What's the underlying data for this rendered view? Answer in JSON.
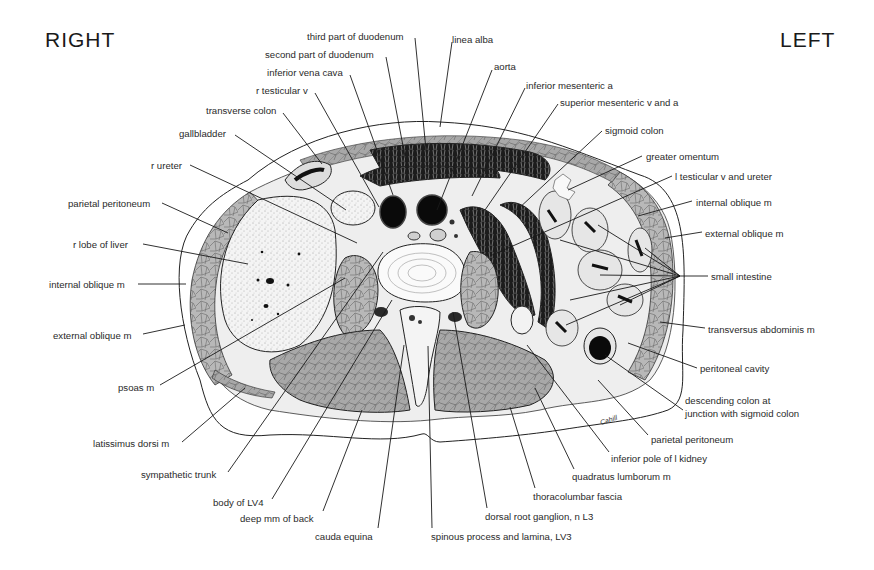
{
  "figure": {
    "orientation": {
      "right_label": "RIGHT",
      "left_label": "LEFT"
    },
    "signature": "Cahill",
    "colors": {
      "ink": "#1a1a1a",
      "muscle": "#9a9a9a",
      "organ_fill": "#f2f2f2",
      "lumen_dark": "#111111",
      "background": "#ffffff"
    }
  },
  "labels": [
    {
      "id": "third-part-of-duodenum",
      "text": "third part of duodenum",
      "x": 307,
      "y": 31,
      "line": [
        [
          415,
          38
        ],
        [
          428,
          170
        ]
      ]
    },
    {
      "id": "second-part-of-duodenum",
      "text": "second part of duodenum",
      "x": 265,
      "y": 49,
      "line": [
        [
          386,
          57
        ],
        [
          408,
          172
        ]
      ]
    },
    {
      "id": "inferior-vena-cava",
      "text": "inferior vena cava",
      "x": 267,
      "y": 67,
      "line": [
        [
          350,
          75
        ],
        [
          393,
          195
        ]
      ]
    },
    {
      "id": "r-testicular-v",
      "text": "r testicular v",
      "x": 256,
      "y": 85,
      "line": [
        [
          315,
          93
        ],
        [
          379,
          207
        ]
      ]
    },
    {
      "id": "transverse-colon",
      "text": "transverse colon",
      "x": 206,
      "y": 105,
      "line": [
        [
          283,
          113
        ],
        [
          322,
          164
        ]
      ]
    },
    {
      "id": "gallbladder",
      "text": "gallbladder",
      "x": 179,
      "y": 128,
      "line": [
        [
          235,
          135
        ],
        [
          346,
          210
        ]
      ]
    },
    {
      "id": "r-ureter",
      "text": "r ureter",
      "x": 151,
      "y": 160,
      "line": [
        [
          190,
          165
        ],
        [
          357,
          243
        ]
      ]
    },
    {
      "id": "parietal-peritoneum-right",
      "text": "parietal peritoneum",
      "x": 68,
      "y": 198,
      "line": [
        [
          162,
          203
        ],
        [
          228,
          233
        ]
      ]
    },
    {
      "id": "r-lobe-of-liver",
      "text": "r lobe of liver",
      "x": 73,
      "y": 239,
      "line": [
        [
          143,
          244
        ],
        [
          248,
          264
        ]
      ]
    },
    {
      "id": "internal-oblique-m-right",
      "text": "internal oblique m",
      "x": 49,
      "y": 279,
      "line": [
        [
          138,
          284
        ],
        [
          186,
          284
        ]
      ]
    },
    {
      "id": "external-oblique-m-right",
      "text": "external oblique m",
      "x": 53,
      "y": 330,
      "line": [
        [
          143,
          334
        ],
        [
          185,
          325
        ]
      ]
    },
    {
      "id": "psoas-m",
      "text": "psoas m",
      "x": 118,
      "y": 382,
      "line": [
        [
          160,
          385
        ],
        [
          345,
          278
        ]
      ]
    },
    {
      "id": "latissimus-dorsi-m",
      "text": "latissimus dorsi m",
      "x": 93,
      "y": 438,
      "line": [
        [
          182,
          442
        ],
        [
          245,
          388
        ]
      ]
    },
    {
      "id": "sympathetic-trunk",
      "text": "sympathetic trunk",
      "x": 141,
      "y": 469,
      "line": [
        [
          228,
          472
        ],
        [
          383,
          252
        ]
      ]
    },
    {
      "id": "body-of-lv4",
      "text": "body of LV4",
      "x": 213,
      "y": 497,
      "line": [
        [
          272,
          499
        ],
        [
          392,
          300
        ]
      ]
    },
    {
      "id": "deep-mm-of-back",
      "text": "deep mm of back",
      "x": 240,
      "y": 513,
      "line": [
        [
          323,
          511
        ],
        [
          362,
          410
        ]
      ]
    },
    {
      "id": "cauda-equina",
      "text": "cauda equina",
      "x": 315,
      "y": 531,
      "line": [
        [
          378,
          528
        ],
        [
          404,
          345
        ]
      ]
    },
    {
      "id": "spinous-process-and-lamina-lv3",
      "text": "spinous process and lamina, LV3",
      "x": 431,
      "y": 531,
      "line": [
        [
          432,
          528
        ],
        [
          428,
          346
        ]
      ]
    },
    {
      "id": "dorsal-root-ganglion-n-l3",
      "text": "dorsal root ganglion, n L3",
      "x": 485,
      "y": 511,
      "line": [
        [
          487,
          508
        ],
        [
          453,
          312
        ]
      ]
    },
    {
      "id": "thoracolumbar-fascia",
      "text": "thoracolumbar fascia",
      "x": 533,
      "y": 491,
      "line": [
        [
          535,
          488
        ],
        [
          510,
          407
        ]
      ]
    },
    {
      "id": "quadratus-lumborum-m",
      "text": "quadratus lumborum m",
      "x": 572,
      "y": 471,
      "line": [
        [
          574,
          469
        ],
        [
          535,
          388
        ]
      ]
    },
    {
      "id": "inferior-pole-of-l-kidney",
      "text": "inferior pole of l kidney",
      "x": 611,
      "y": 453,
      "line": [
        [
          609,
          452
        ],
        [
          527,
          345
        ]
      ]
    },
    {
      "id": "parietal-peritoneum-left",
      "text": "parietal peritoneum",
      "x": 651,
      "y": 434,
      "line": [
        [
          648,
          435
        ],
        [
          598,
          380
        ]
      ]
    },
    {
      "id": "descending-colon-junction",
      "text": "descending colon at\njunction with sigmoid colon",
      "x": 685,
      "y": 394,
      "multi": true,
      "line": [
        [
          683,
          410
        ],
        [
          605,
          355
        ]
      ]
    },
    {
      "id": "peritoneal-cavity",
      "text": "peritoneal cavity",
      "x": 700,
      "y": 363,
      "line": [
        [
          697,
          368
        ],
        [
          628,
          343
        ]
      ]
    },
    {
      "id": "transversus-abdominis-m",
      "text": "transversus abdominis m",
      "x": 708,
      "y": 324,
      "line": [
        [
          705,
          328
        ],
        [
          660,
          322
        ]
      ]
    },
    {
      "id": "small-intestine",
      "text": "small intestine",
      "x": 711,
      "y": 271,
      "fan": [
        680,
        276
      ],
      "fan_targets": [
        [
          598,
          225
        ],
        [
          560,
          240
        ],
        [
          645,
          248
        ],
        [
          600,
          275
        ],
        [
          570,
          300
        ],
        [
          620,
          305
        ],
        [
          566,
          325
        ]
      ]
    },
    {
      "id": "external-oblique-m-left",
      "text": "external oblique m",
      "x": 705,
      "y": 228,
      "line": [
        [
          702,
          232
        ],
        [
          665,
          238
        ]
      ]
    },
    {
      "id": "internal-oblique-m-left",
      "text": "internal oblique m",
      "x": 696,
      "y": 197,
      "line": [
        [
          692,
          201
        ],
        [
          638,
          216
        ]
      ]
    },
    {
      "id": "l-testicular-v-and-ureter",
      "text": "l testicular v and ureter",
      "x": 675,
      "y": 171,
      "line": [
        [
          672,
          176
        ],
        [
          490,
          256
        ]
      ]
    },
    {
      "id": "greater-omentum",
      "text": "greater omentum",
      "x": 646,
      "y": 151,
      "line": [
        [
          642,
          156
        ],
        [
          568,
          190
        ]
      ]
    },
    {
      "id": "sigmoid-colon",
      "text": "sigmoid colon",
      "x": 605,
      "y": 125,
      "line": [
        [
          602,
          131
        ],
        [
          517,
          210
        ]
      ]
    },
    {
      "id": "superior-mesenteric-v-and-a",
      "text": "superior mesenteric v and a",
      "x": 560,
      "y": 97,
      "line": [
        [
          558,
          104
        ],
        [
          485,
          210
        ]
      ]
    },
    {
      "id": "inferior-mesenteric-a",
      "text": "inferior mesenteric a",
      "x": 526,
      "y": 80,
      "line": [
        [
          525,
          88
        ],
        [
          472,
          196
        ]
      ]
    },
    {
      "id": "aorta",
      "text": "aorta",
      "x": 494,
      "y": 61,
      "line": [
        [
          492,
          70
        ],
        [
          437,
          210
        ]
      ]
    },
    {
      "id": "linea-alba",
      "text": "linea alba",
      "x": 452,
      "y": 34,
      "line": [
        [
          452,
          42
        ],
        [
          440,
          127
        ]
      ]
    }
  ]
}
